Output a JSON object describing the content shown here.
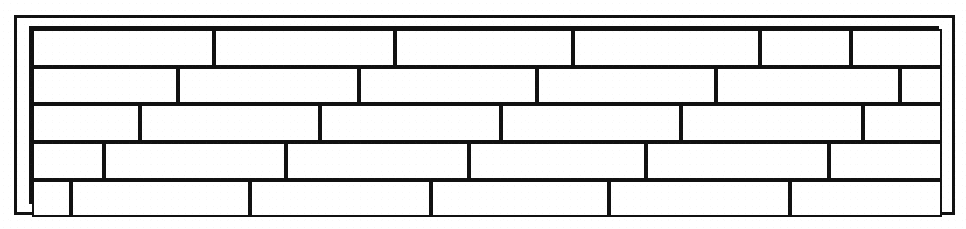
{
  "figure": {
    "kind": "brick-wall-elevation",
    "canvas": {
      "width": 966,
      "height": 229
    },
    "colors": {
      "background": "#ffffff",
      "line": "#111111",
      "brick_fill": "#ffffff"
    },
    "outer_frame": {
      "x": 14,
      "y": 15,
      "width": 941,
      "height": 200,
      "stroke_width": 3
    },
    "wall_area": {
      "x": 29,
      "y": 26,
      "width": 910,
      "height": 178,
      "stroke_width": 3
    },
    "brick_stroke_width": 2,
    "course_count": 5,
    "total_brick_count": 28,
    "courses": [
      {
        "index": 1,
        "name": "course-1",
        "y": 26,
        "height": 38,
        "brick_count": 6,
        "bricks": [
          {
            "index": 1,
            "x": 29,
            "width": 182,
            "label": "full-brick"
          },
          {
            "index": 2,
            "x": 211,
            "width": 181,
            "label": "full-brick"
          },
          {
            "index": 3,
            "x": 392,
            "width": 178,
            "label": "full-brick"
          },
          {
            "index": 4,
            "x": 570,
            "width": 187,
            "label": "full-brick"
          },
          {
            "index": 5,
            "x": 757,
            "width": 91,
            "label": "half-brick"
          },
          {
            "index": 6,
            "x": 848,
            "width": 91,
            "label": "half-brick"
          }
        ]
      },
      {
        "index": 2,
        "name": "course-2",
        "y": 64,
        "height": 37,
        "brick_count": 6,
        "bricks": [
          {
            "index": 1,
            "x": 29,
            "width": 146,
            "label": "three-quarter-brick"
          },
          {
            "index": 2,
            "x": 175,
            "width": 181,
            "label": "full-brick"
          },
          {
            "index": 3,
            "x": 356,
            "width": 178,
            "label": "full-brick"
          },
          {
            "index": 4,
            "x": 534,
            "width": 179,
            "label": "full-brick"
          },
          {
            "index": 5,
            "x": 713,
            "width": 184,
            "label": "full-brick"
          },
          {
            "index": 6,
            "x": 897,
            "width": 42,
            "label": "quarter-brick"
          }
        ]
      },
      {
        "index": 3,
        "name": "course-3",
        "y": 101,
        "height": 38,
        "brick_count": 6,
        "bricks": [
          {
            "index": 1,
            "x": 29,
            "width": 108,
            "label": "half-brick"
          },
          {
            "index": 2,
            "x": 137,
            "width": 180,
            "label": "full-brick"
          },
          {
            "index": 3,
            "x": 317,
            "width": 181,
            "label": "full-brick"
          },
          {
            "index": 4,
            "x": 498,
            "width": 180,
            "label": "full-brick"
          },
          {
            "index": 5,
            "x": 678,
            "width": 182,
            "label": "full-brick"
          },
          {
            "index": 6,
            "x": 860,
            "width": 79,
            "label": "half-brick"
          }
        ]
      },
      {
        "index": 4,
        "name": "course-4",
        "y": 139,
        "height": 38,
        "brick_count": 6,
        "bricks": [
          {
            "index": 1,
            "x": 29,
            "width": 72,
            "label": "quarter-brick"
          },
          {
            "index": 2,
            "x": 101,
            "width": 182,
            "label": "full-brick"
          },
          {
            "index": 3,
            "x": 283,
            "width": 183,
            "label": "full-brick"
          },
          {
            "index": 4,
            "x": 466,
            "width": 177,
            "label": "full-brick"
          },
          {
            "index": 5,
            "x": 643,
            "width": 183,
            "label": "full-brick"
          },
          {
            "index": 6,
            "x": 826,
            "width": 113,
            "label": "half-brick"
          }
        ]
      },
      {
        "index": 5,
        "name": "course-5",
        "y": 177,
        "height": 37,
        "brick_count": 6,
        "bricks": [
          {
            "index": 1,
            "x": 29,
            "width": 39,
            "label": "quarter-brick"
          },
          {
            "index": 2,
            "x": 68,
            "width": 179,
            "label": "full-brick"
          },
          {
            "index": 3,
            "x": 247,
            "width": 181,
            "label": "full-brick"
          },
          {
            "index": 4,
            "x": 428,
            "width": 178,
            "label": "full-brick"
          },
          {
            "index": 5,
            "x": 606,
            "width": 181,
            "label": "full-brick"
          },
          {
            "index": 6,
            "x": 787,
            "width": 152,
            "label": "three-quarter-brick"
          }
        ]
      }
    ]
  }
}
